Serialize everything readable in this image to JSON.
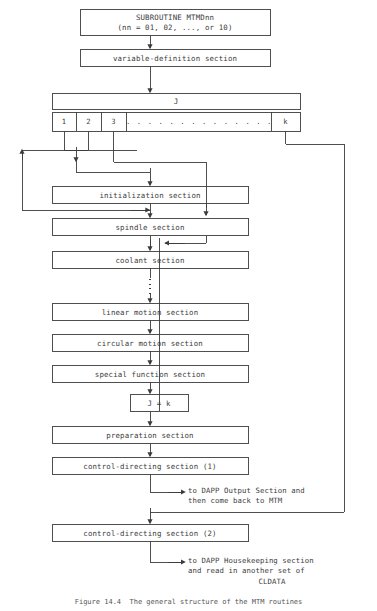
{
  "figure": {
    "caption": "Figure 14.4  The general structure of the MTM routines",
    "line_color": "#3c3c3c",
    "text_color": "#3c3c3c",
    "background": "#ffffff"
  },
  "boxes": {
    "subroutine": {
      "line1": "SUBROUTINE MTMDnn",
      "line2": "(nn = 01, 02, ..., or 10)"
    },
    "variable_definition": "variable-definition section",
    "j_header": "J",
    "initialization": "initialization section",
    "spindle": "spindle section",
    "coolant": "coolant section",
    "linear_motion": "linear motion section",
    "circular_motion": "circular motion section",
    "special_function": "special function section",
    "j_equals_k": "J = k",
    "preparation": "preparation section",
    "control_directing_1": "control-directing section (1)",
    "control_directing_2": "control-directing section (2)"
  },
  "j_cells": [
    {
      "label": "1"
    },
    {
      "label": "2"
    },
    {
      "label": "3"
    },
    {
      "label": ". . . . . . . . . . . . . ."
    },
    {
      "label": "k"
    }
  ],
  "annotations": [
    {
      "id": "dapp-output",
      "line1": "to DAPP Output Section and",
      "line2": "then come back to MTM"
    },
    {
      "id": "dapp-housekeeping",
      "line1": "to DAPP Housekeeping section",
      "line2": "and read in another set of",
      "line3": "CLDATA"
    }
  ]
}
